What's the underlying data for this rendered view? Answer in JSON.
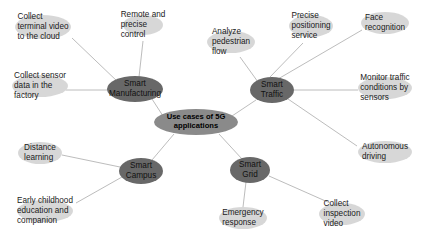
{
  "diagram": {
    "type": "mind-map",
    "title": "Use cases of 5G applications",
    "colors": {
      "root_fill": "#8a8a8a",
      "hub_fill": "#686868",
      "leaf_fill": "#d2d2d2",
      "edge_stroke": "#b4b4b4",
      "background": "#ffffff",
      "text": "#1a1a1a"
    },
    "root": {
      "id": "root",
      "label": "Use cases of 5G\napplications",
      "x": 196,
      "y": 122,
      "rx": 42,
      "ry": 13
    },
    "hubs": [
      {
        "id": "smart-manufacturing",
        "label": "Smart\nManufacturing",
        "x": 135,
        "y": 89,
        "rx": 28,
        "ry": 13
      },
      {
        "id": "smart-traffic",
        "label": "Smart\nTraffic",
        "x": 272,
        "y": 90,
        "rx": 22,
        "ry": 13
      },
      {
        "id": "smart-campus",
        "label": "Smart\nCampus",
        "x": 141,
        "y": 171,
        "rx": 22,
        "ry": 13
      },
      {
        "id": "smart-grid",
        "label": "Smart\nGrid",
        "x": 250,
        "y": 170,
        "rx": 20,
        "ry": 13
      }
    ],
    "leaves": [
      {
        "id": "collect-terminal-video",
        "label": "Collect\nterminal video\nto the cloud",
        "parent": "smart-manufacturing",
        "x": 43,
        "y": 27,
        "rx": 28,
        "ry": 12,
        "align": "left",
        "anchor_x": 72,
        "anchor_y": 38
      },
      {
        "id": "remote-precise-control",
        "label": "Remote and\nprecise\ncontrol",
        "parent": "smart-manufacturing",
        "x": 143,
        "y": 25,
        "rx": 20,
        "ry": 10,
        "align": "left",
        "anchor_x": 143,
        "anchor_y": 40
      },
      {
        "id": "collect-sensor-data",
        "label": "Collect sensor\ndata in the\nfactory",
        "parent": "smart-manufacturing",
        "x": 40,
        "y": 86,
        "rx": 28,
        "ry": 11,
        "align": "left",
        "anchor_x": 72,
        "anchor_y": 90
      },
      {
        "id": "analyze-pedestrian-flow",
        "label": "Analyze\npedestrian\nflow",
        "parent": "smart-traffic",
        "x": 231,
        "y": 42,
        "rx": 24,
        "ry": 11,
        "align": "left",
        "anchor_x": 240,
        "anchor_y": 56
      },
      {
        "id": "precise-positioning-service",
        "label": "Precise\npositioning\nservice",
        "parent": "smart-traffic",
        "x": 311,
        "y": 26,
        "rx": 22,
        "ry": 11,
        "align": "left",
        "anchor_x": 305,
        "anchor_y": 42
      },
      {
        "id": "face-recognition",
        "label": "Face\nrecognition",
        "parent": "smart-traffic",
        "x": 385,
        "y": 23,
        "rx": 24,
        "ry": 11,
        "align": "left",
        "anchor_x": 362,
        "anchor_y": 30
      },
      {
        "id": "monitor-traffic-conditions",
        "label": "Monitor traffic\nconditions by\nsensors",
        "parent": "smart-traffic",
        "x": 385,
        "y": 88,
        "rx": 27,
        "ry": 11,
        "align": "left",
        "anchor_x": 358,
        "anchor_y": 90
      },
      {
        "id": "autonomous-driving",
        "label": "Autonomous\ndriving",
        "parent": "smart-traffic",
        "x": 385,
        "y": 152,
        "rx": 27,
        "ry": 11,
        "align": "left",
        "anchor_x": 357,
        "anchor_y": 146
      },
      {
        "id": "distance-learning",
        "label": "Distance\nlearning",
        "parent": "smart-campus",
        "x": 40,
        "y": 153,
        "rx": 22,
        "ry": 11,
        "align": "left",
        "anchor_x": 62,
        "anchor_y": 155
      },
      {
        "id": "early-childhood-education",
        "label": "Early childhood\neducation and\ncompanion",
        "parent": "smart-campus",
        "x": 45,
        "y": 211,
        "rx": 28,
        "ry": 11,
        "align": "left",
        "anchor_x": 76,
        "anchor_y": 203
      },
      {
        "id": "emergency-response",
        "label": "Emergency\nresponse",
        "parent": "smart-grid",
        "x": 243,
        "y": 218,
        "rx": 24,
        "ry": 11,
        "align": "left",
        "anchor_x": 243,
        "anchor_y": 207
      },
      {
        "id": "collect-inspection-video",
        "label": "Collect\ninspection\nvideo",
        "parent": "smart-grid",
        "x": 342,
        "y": 214,
        "rx": 23,
        "ry": 11,
        "align": "left",
        "anchor_x": 330,
        "anchor_y": 203
      }
    ],
    "edges": [
      {
        "id": "edge-root-smart-manufacturing",
        "from": "root",
        "to": "smart-manufacturing",
        "x1": 163,
        "y1": 116,
        "x2": 152,
        "y2": 99
      },
      {
        "id": "edge-root-smart-traffic",
        "from": "root",
        "to": "smart-traffic",
        "x1": 232,
        "y1": 116,
        "x2": 256,
        "y2": 100
      },
      {
        "id": "edge-root-smart-campus",
        "from": "root",
        "to": "smart-campus",
        "x1": 174,
        "y1": 134,
        "x2": 152,
        "y2": 160
      },
      {
        "id": "edge-root-smart-grid",
        "from": "root",
        "to": "smart-grid",
        "x1": 219,
        "y1": 134,
        "x2": 242,
        "y2": 159
      },
      {
        "id": "edge-smart-manufacturing-collect-terminal-video",
        "from": "smart-manufacturing",
        "to": "collect-terminal-video",
        "x1": 119,
        "y1": 83,
        "x2": 72,
        "y2": 38
      },
      {
        "id": "edge-smart-manufacturing-remote-precise-control",
        "from": "smart-manufacturing",
        "to": "remote-precise-control",
        "x1": 139,
        "y1": 77,
        "x2": 143,
        "y2": 41
      },
      {
        "id": "edge-smart-manufacturing-collect-sensor-data",
        "from": "smart-manufacturing",
        "to": "collect-sensor-data",
        "x1": 108,
        "y1": 90,
        "x2": 66,
        "y2": 90
      },
      {
        "id": "edge-smart-traffic-analyze-pedestrian-flow",
        "from": "smart-traffic",
        "to": "analyze-pedestrian-flow",
        "x1": 258,
        "y1": 82,
        "x2": 240,
        "y2": 57
      },
      {
        "id": "edge-smart-traffic-precise-positioning",
        "from": "smart-traffic",
        "to": "precise-positioning-service",
        "x1": 270,
        "y1": 77,
        "x2": 303,
        "y2": 43
      },
      {
        "id": "edge-smart-traffic-face-recognition",
        "from": "smart-traffic",
        "to": "face-recognition",
        "x1": 278,
        "y1": 79,
        "x2": 362,
        "y2": 30
      },
      {
        "id": "edge-smart-traffic-monitor-traffic",
        "from": "smart-traffic",
        "to": "monitor-traffic-conditions",
        "x1": 294,
        "y1": 90,
        "x2": 358,
        "y2": 90
      },
      {
        "id": "edge-smart-traffic-autonomous-driving",
        "from": "smart-traffic",
        "to": "autonomous-driving",
        "x1": 288,
        "y1": 99,
        "x2": 357,
        "y2": 146
      },
      {
        "id": "edge-smart-campus-distance-learning",
        "from": "smart-campus",
        "to": "distance-learning",
        "x1": 120,
        "y1": 167,
        "x2": 62,
        "y2": 155
      },
      {
        "id": "edge-smart-campus-early-childhood",
        "from": "smart-campus",
        "to": "early-childhood-education",
        "x1": 122,
        "y1": 177,
        "x2": 76,
        "y2": 203
      },
      {
        "id": "edge-smart-grid-emergency-response",
        "from": "smart-grid",
        "to": "emergency-response",
        "x1": 246,
        "y1": 182,
        "x2": 243,
        "y2": 207
      },
      {
        "id": "edge-smart-grid-collect-inspection-video",
        "from": "smart-grid",
        "to": "collect-inspection-video",
        "x1": 269,
        "y1": 176,
        "x2": 330,
        "y2": 203
      }
    ]
  }
}
